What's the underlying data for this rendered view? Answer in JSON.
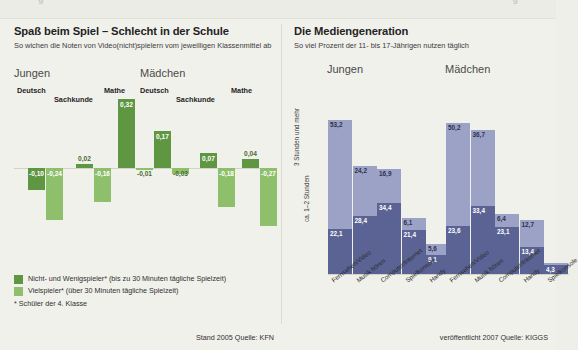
{
  "colors": {
    "bg": "#f1f1ec",
    "green_dark": "#5f9641",
    "green_light": "#8ebf6b",
    "blue_dark": "#5a6394",
    "blue_light": "#9ca2c6"
  },
  "topstrip": {
    "ghost_left": "g",
    "ghost_right": "g"
  },
  "left": {
    "title": "Spaß beim Spiel – Schlecht in der Schule",
    "subtitle": "So wichen die Noten von Video(nicht)spielern vom jeweilligen Klassenmittel ab",
    "groups": [
      {
        "name": "Jungen"
      },
      {
        "name": "Mädchen"
      }
    ],
    "subjects": [
      "Deutsch",
      "Sachkunde",
      "Mathe"
    ],
    "legend": [
      {
        "label": "Nicht- und Wenigspieler* (bis zu 30 Minuten tägliche Spielzeit)",
        "color": "#5f9641"
      },
      {
        "label": "Vielspieler* (über 30 Minuten tägliche Spielzeit)",
        "color": "#8ebf6b"
      }
    ],
    "footnote": "* Schüler der 4. Klasse",
    "source": "Stand 2005  Quelle: KFN",
    "chart_data": {
      "type": "bar",
      "title": "Spaß beim Spiel – Schlecht in der Schule",
      "ylabel": "Abweichung vom Klassenmittel",
      "xlabel": "",
      "grid": false,
      "zero_line": true,
      "ylim": [
        -0.6,
        0.35
      ],
      "categories": [
        "Jungen Deutsch",
        "Jungen Sachkunde",
        "Jungen Mathe",
        "Mädchen Deutsch",
        "Mädchen Sachkunde",
        "Mädchen Mathe"
      ],
      "series": [
        {
          "name": "Nicht- und Wenigspieler*",
          "color": "#5f9641",
          "values": [
            -0.1,
            0.02,
            0.32,
            0.17,
            0.07,
            0.04
          ],
          "labels": [
            "-0,10",
            "0,02",
            "0,32",
            "0,17",
            "0,07",
            "0,04"
          ]
        },
        {
          "name": "Vielspieler*",
          "color": "#8ebf6b",
          "values": [
            -0.24,
            -0.16,
            -0.01,
            -0.03,
            -0.18,
            -0.27
          ],
          "labels": [
            "-0,24",
            "-0,16",
            "-0,01",
            "-0,03",
            "-0,18",
            "-0,27"
          ]
        }
      ]
    }
  },
  "right": {
    "title": "Die Mediengeneration",
    "subtitle": "So viel Prozent der 11- bis 17-Jährigen nutzen täglich",
    "groups": [
      {
        "name": "Jungen"
      },
      {
        "name": "Mädchen"
      }
    ],
    "axis_labels": [
      "3 Stunden und mehr",
      "ca. 1–2 Stunden"
    ],
    "source": "veröffentlicht 2007  Quelle: KIGGS",
    "chart_data": {
      "type": "bar",
      "subtype": "stacked",
      "title": "Die Mediengeneration",
      "ylabel": "Prozent",
      "xlabel": "",
      "grid": false,
      "ylim": [
        0,
        80
      ],
      "legend_position": "y-axis",
      "groups": [
        {
          "name": "Jungen",
          "categories": [
            "Fernsehen/Video",
            "Musik hören",
            "Computer/Internet",
            "Spielkonsole",
            "Handy"
          ],
          "series": [
            {
              "name": "3 Stunden und mehr",
              "color": "#5a6394",
              "values": [
                22.1,
                28.4,
                34.4,
                21.4,
                9.1
              ],
              "labels": [
                "22,1",
                "28,4",
                "34,4",
                "21,4",
                "9,1"
              ]
            },
            {
              "name": "ca. 1–2 Stunden",
              "color": "#9ca2c6",
              "values": [
                53.2,
                24.2,
                16.9,
                6.1,
                5.6
              ],
              "labels": [
                "53,2",
                "24,2",
                "16,9",
                "6,1",
                "5,6"
              ]
            }
          ]
        },
        {
          "name": "Mädchen",
          "categories": [
            "Fernsehen/Video",
            "Musik hören",
            "Computer/Internet",
            "Handy",
            "Spielkonsole"
          ],
          "series": [
            {
              "name": "3 Stunden und mehr",
              "color": "#5a6394",
              "values": [
                23.6,
                33.4,
                23.1,
                13.4,
                4.3
              ],
              "labels": [
                "23,6",
                "33,4",
                "23,1",
                "13,4",
                "4,3"
              ]
            },
            {
              "name": "ca. 1–2 Stunden",
              "color": "#9ca2c6",
              "values": [
                50.2,
                36.7,
                6.4,
                12.7,
                1.1
              ],
              "labels": [
                "50,2",
                "36,7",
                "6,4",
                "12,7",
                "1,1"
              ]
            }
          ]
        }
      ]
    }
  }
}
